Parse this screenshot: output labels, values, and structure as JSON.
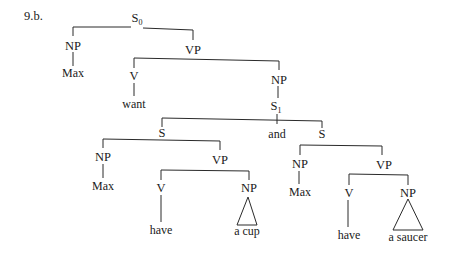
{
  "example_label": "9.b.",
  "tree": {
    "root": {
      "label": "S",
      "subscript": "0"
    },
    "root_np": {
      "label": "NP",
      "word": "Max"
    },
    "root_vp": {
      "label": "VP"
    },
    "main_v": {
      "label": "V",
      "word": "want"
    },
    "main_np": {
      "label": "NP"
    },
    "s1": {
      "label": "S",
      "subscript": "1"
    },
    "conj": "and",
    "left_s": {
      "label": "S",
      "np": {
        "label": "NP",
        "word": "Max"
      },
      "vp": {
        "label": "VP"
      },
      "v": {
        "label": "V",
        "word": "have"
      },
      "obj": {
        "label": "NP",
        "phrase": "a cup"
      }
    },
    "right_s": {
      "label": "S",
      "np": {
        "label": "NP",
        "word": "Max"
      },
      "vp": {
        "label": "VP"
      },
      "v": {
        "label": "V",
        "word": "have"
      },
      "obj": {
        "label": "NP",
        "phrase": "a saucer"
      }
    }
  }
}
